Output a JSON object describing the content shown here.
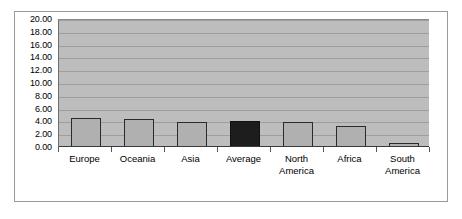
{
  "chart_data": {
    "type": "bar",
    "title": "",
    "subtitle": "",
    "xlabel": "",
    "ylabel": "",
    "categories": [
      "Europe",
      "Oceania",
      "Asia",
      "Average",
      "North America",
      "Africa",
      "South America"
    ],
    "values": [
      4.5,
      4.4,
      3.9,
      4.0,
      3.9,
      3.3,
      0.6
    ],
    "ylim": [
      0,
      20
    ],
    "ytick_step": 2,
    "ytick_labels": [
      "20.00",
      "18.00",
      "16.00",
      "14.00",
      "12.00",
      "10.00",
      "8.00",
      "6.00",
      "4.00",
      "2.00",
      "0.00"
    ],
    "ytick_values": [
      20,
      18,
      16,
      14,
      12,
      10,
      8,
      6,
      4,
      2,
      0
    ],
    "grid": true,
    "legend": false,
    "legend_position": "none",
    "bar_colors": [
      "#b0b0b0",
      "#b0b0b0",
      "#b0b0b0",
      "#1d1d1d",
      "#b0b0b0",
      "#b0b0b0",
      "#b0b0b0"
    ],
    "highlighted_category": "Average",
    "plot_background": "#bdbdbd",
    "bar_border_color": "#2b2b2b",
    "gridline_color": "#9e9e9e",
    "frame_border_color": "#9a9a9a",
    "category_label_lines": [
      [
        "Europe"
      ],
      [
        "Oceania"
      ],
      [
        "Asia"
      ],
      [
        "Average"
      ],
      [
        "North",
        "America"
      ],
      [
        "Africa"
      ],
      [
        "South",
        "America"
      ]
    ]
  }
}
